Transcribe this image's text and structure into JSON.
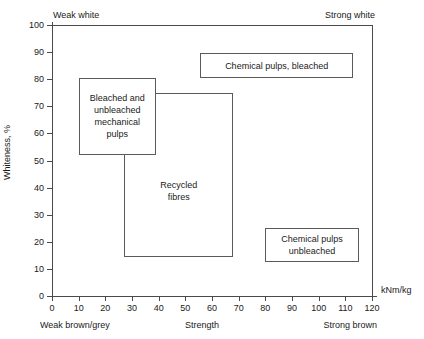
{
  "chart_data": {
    "type": "scatter",
    "title": "",
    "xlabel": "Strength",
    "ylabel": "Whiteness, %",
    "x_unit": "kNm/kg",
    "xlim": [
      0,
      120
    ],
    "ylim": [
      0,
      100
    ],
    "grid": false,
    "legend": "none",
    "x_ticks": [
      0,
      10,
      20,
      30,
      40,
      50,
      60,
      70,
      80,
      90,
      100,
      110,
      120
    ],
    "y_ticks": [
      0,
      10,
      20,
      30,
      40,
      50,
      60,
      70,
      80,
      90,
      100
    ],
    "corner_annotations": {
      "top_left": "Weak white",
      "top_right": "Strong white",
      "bottom_left": "Weak brown/grey",
      "bottom_right": "Strong brown"
    },
    "regions": [
      {
        "name": "mechanical-pulps",
        "label": "Bleached and\nunbleached\nmechanical\npulps",
        "x0": 10,
        "x1": 39,
        "y0": 52,
        "y1": 80.5,
        "kind": "region"
      },
      {
        "name": "recycled-fibres",
        "label": "Recycled\nfibres",
        "x0": 27,
        "x1": 68,
        "y0": 14.5,
        "y1": 75,
        "kind": "region"
      },
      {
        "name": "chemical-pulps-bleached",
        "label": "Chemical pulps, bleached",
        "x0": 55.5,
        "x1": 113,
        "y0": 80.5,
        "y1": 89.5,
        "kind": "callout"
      },
      {
        "name": "chemical-pulps-unbleached",
        "label": "Chemical pulps\nunbleached",
        "x0": 80,
        "x1": 115,
        "y0": 12.5,
        "y1": 25,
        "kind": "callout"
      }
    ],
    "colors": {
      "axis": "#4a4a4a",
      "box_border": "#5a5a5a",
      "text": "#1a1a1a",
      "background": "#ffffff"
    }
  }
}
